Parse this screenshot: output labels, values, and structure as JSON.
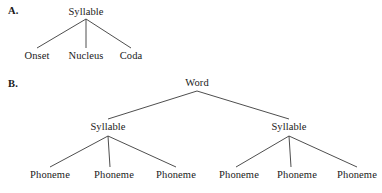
{
  "figure": {
    "panels": [
      {
        "id": "panel-a",
        "label": "A.",
        "label_x": 8,
        "label_y": 5,
        "root": {
          "text": "Syllable",
          "x": 86,
          "y": 6,
          "apex_x": 86,
          "apex_y": 19
        },
        "children": [
          {
            "text": "Onset",
            "x": 37,
            "y": 50,
            "top_y": 48
          },
          {
            "text": "Nucleus",
            "x": 86,
            "y": 50,
            "top_y": 48
          },
          {
            "text": "Coda",
            "x": 131,
            "y": 50,
            "top_y": 48
          }
        ]
      },
      {
        "id": "panel-b",
        "label": "B.",
        "label_x": 8,
        "label_y": 78,
        "root": {
          "text": "Word",
          "x": 197,
          "y": 77,
          "apex_x": 197,
          "apex_y": 91
        },
        "level2": [
          {
            "text": "Syllable",
            "x": 108,
            "y": 121,
            "top_y": 119,
            "apex_x": 108,
            "apex_y": 136,
            "children": [
              {
                "text": "Phoneme",
                "x": 50,
                "y": 169,
                "top_y": 167
              },
              {
                "text": "Phoneme",
                "x": 114,
                "y": 169,
                "top_y": 167
              },
              {
                "text": "Phoneme",
                "x": 176,
                "y": 169,
                "top_y": 167
              }
            ]
          },
          {
            "text": "Syllable",
            "x": 289,
            "y": 121,
            "top_y": 119,
            "apex_x": 289,
            "apex_y": 136,
            "children": [
              {
                "text": "Phoneme",
                "x": 239,
                "y": 169,
                "top_y": 167
              },
              {
                "text": "Phoneme",
                "x": 297,
                "y": 169,
                "top_y": 167
              },
              {
                "text": "Phoneme",
                "x": 357,
                "y": 169,
                "top_y": 167
              }
            ]
          }
        ]
      }
    ],
    "colors": {
      "line": "#3a3a3a",
      "text": "#1a1a1a",
      "background": "#ffffff"
    }
  }
}
